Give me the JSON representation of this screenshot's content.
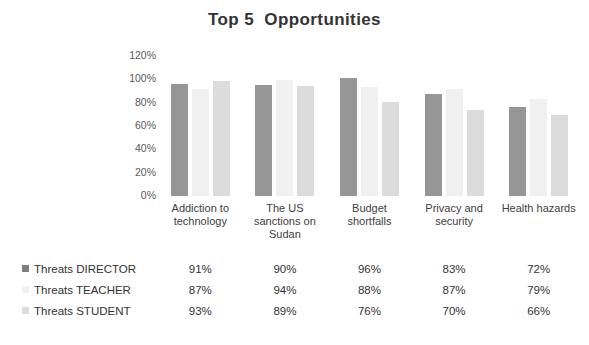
{
  "chart_data": {
    "type": "bar",
    "title": "Top 5  Opportunities",
    "xlabel": "",
    "ylabel": "",
    "ylim": [
      0,
      120
    ],
    "ytick_labels": [
      "120%",
      "100%",
      "80%",
      "60%",
      "40%",
      "20%",
      "0%"
    ],
    "grid": false,
    "legend_position": "bottom-table",
    "categories": [
      "Addiction to technology",
      "The US sanctions on Sudan",
      "Budget shortfalls",
      "Privacy and security",
      "Health hazards"
    ],
    "series": [
      {
        "name": "Threats DIRECTOR",
        "color": "#969696",
        "values": [
          91,
          90,
          96,
          83,
          72
        ],
        "labels": [
          "91%",
          "90%",
          "96%",
          "83%",
          "72%"
        ]
      },
      {
        "name": "Threats TEACHER",
        "color": "#f0f0f0",
        "values": [
          87,
          94,
          88,
          87,
          79
        ],
        "labels": [
          "87%",
          "94%",
          "88%",
          "87%",
          "79%"
        ]
      },
      {
        "name": "Threats STUDENT",
        "color": "#dcdcdc",
        "values": [
          93,
          89,
          76,
          70,
          66
        ],
        "labels": [
          "93%",
          "89%",
          "76%",
          "70%",
          "66%"
        ]
      }
    ]
  }
}
